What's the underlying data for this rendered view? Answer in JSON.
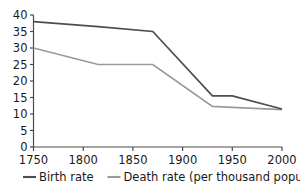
{
  "chart_data": {
    "type": "line",
    "title": "",
    "subtitle": "",
    "xlabel": "",
    "ylabel": "",
    "xlim": [
      1750,
      2000
    ],
    "ylim": [
      0,
      40
    ],
    "grid": false,
    "legend_position": "bottom",
    "x_ticks": [
      1750,
      1800,
      1850,
      1900,
      1950,
      2000
    ],
    "x_tick_labels": [
      "1750",
      "1800",
      "1850",
      "1900",
      "1950",
      "2000"
    ],
    "y_ticks": [
      0,
      5,
      10,
      15,
      20,
      25,
      30,
      35,
      40
    ],
    "y_tick_labels": [
      "0",
      "5",
      "10",
      "15",
      "20",
      "25",
      "30",
      "35",
      "40"
    ],
    "series": [
      {
        "name": "Birth rate",
        "color": "#4d4d4d",
        "x": [
          1750,
          1815,
          1870,
          1930,
          1950,
          2000
        ],
        "values": [
          38,
          36.5,
          35,
          15.5,
          15.5,
          11.5
        ]
      },
      {
        "name": "Death rate (per thousand population)",
        "color": "#9a9a9a",
        "x": [
          1750,
          1815,
          1870,
          1930,
          1950,
          2000
        ],
        "values": [
          30,
          25,
          25,
          12.3,
          12,
          11.3
        ]
      }
    ],
    "legend": [
      {
        "label": "Birth rate",
        "color": "#4d4d4d"
      },
      {
        "label": "Death rate (per thousand population)",
        "color": "#9a9a9a"
      }
    ]
  },
  "colors": {
    "background": "#ffffff",
    "axis": "#4a4a4a",
    "text": "#1a1a1a",
    "birth_rate": "#4d4d4d",
    "death_rate": "#9a9a9a"
  }
}
